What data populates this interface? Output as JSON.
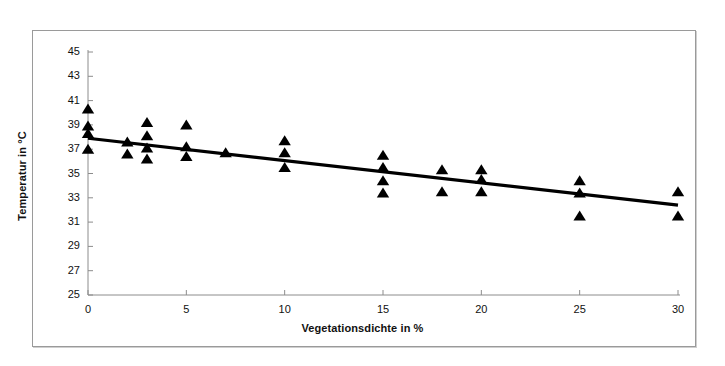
{
  "chart_data": {
    "type": "scatter",
    "title": "",
    "xlabel": "Vegetationsdichte in %",
    "ylabel": "Temperatur in °C",
    "xlim": [
      0,
      30
    ],
    "ylim": [
      25,
      45
    ],
    "xticks": [
      0,
      5,
      10,
      15,
      20,
      25,
      30
    ],
    "xtick_labels": [
      "0",
      "5",
      "10",
      "15",
      "20",
      "25",
      "30"
    ],
    "yticks": [
      25,
      27,
      29,
      31,
      33,
      35,
      37,
      39,
      41,
      43,
      45
    ],
    "ytick_labels": [
      "25",
      "27",
      "29",
      "31",
      "33",
      "35",
      "37",
      "39",
      "41",
      "43",
      "45"
    ],
    "grid": false,
    "legend": null,
    "marker": "triangle-up",
    "marker_color": "#000000",
    "series": [
      {
        "name": "Messpunkte",
        "points": [
          [
            0,
            40.3
          ],
          [
            0,
            38.9
          ],
          [
            0,
            38.3
          ],
          [
            0,
            37.0
          ],
          [
            2,
            37.6
          ],
          [
            2,
            36.6
          ],
          [
            3,
            39.2
          ],
          [
            3,
            38.1
          ],
          [
            3,
            37.1
          ],
          [
            3,
            36.2
          ],
          [
            5,
            39.0
          ],
          [
            5,
            37.2
          ],
          [
            5,
            36.4
          ],
          [
            7,
            36.7
          ],
          [
            10,
            37.7
          ],
          [
            10,
            36.7
          ],
          [
            10,
            35.5
          ],
          [
            15,
            36.5
          ],
          [
            15,
            35.5
          ],
          [
            15,
            34.4
          ],
          [
            15,
            33.4
          ],
          [
            18,
            35.3
          ],
          [
            18,
            33.5
          ],
          [
            20,
            35.3
          ],
          [
            20,
            34.5
          ],
          [
            20,
            33.5
          ],
          [
            25,
            34.4
          ],
          [
            25,
            33.4
          ],
          [
            25,
            31.5
          ],
          [
            30,
            33.5
          ],
          [
            30,
            31.5
          ]
        ]
      }
    ],
    "trendline": {
      "type": "linear",
      "color": "#000000",
      "x_start": 0,
      "y_start": 37.9,
      "x_end": 30,
      "y_end": 32.4
    }
  },
  "axes": {
    "x_axis_name": "x-axis",
    "y_axis_name": "y-axis"
  }
}
